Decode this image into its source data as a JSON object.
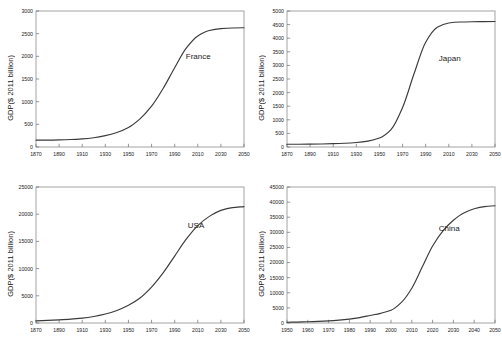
{
  "figure": {
    "panel_count": 4,
    "shared_ylabel": "GDP($ 2011 billion)",
    "background_color": "#ffffff",
    "curve_color": "#3a3a3a",
    "axis_color": "#9a9a9a"
  },
  "chart_data": [
    {
      "type": "line",
      "title": "",
      "annotation": "France",
      "xlabel": "",
      "ylabel": "GDP($ 2011 billion)",
      "xlim": [
        1870,
        2050
      ],
      "ylim": [
        0,
        3000
      ],
      "xticks": [
        1870,
        1890,
        1910,
        1930,
        1950,
        1970,
        1990,
        2010,
        2030,
        2050
      ],
      "yticks": [
        0,
        500,
        1000,
        1500,
        2000,
        2500,
        3000
      ],
      "grid": false,
      "legend": "none",
      "x": [
        1870,
        1880,
        1890,
        1900,
        1910,
        1920,
        1930,
        1940,
        1950,
        1960,
        1970,
        1980,
        1990,
        2000,
        2010,
        2020,
        2030,
        2040,
        2050
      ],
      "values": [
        150,
        152,
        157,
        165,
        180,
        205,
        250,
        320,
        430,
        620,
        900,
        1290,
        1750,
        2180,
        2450,
        2570,
        2610,
        2625,
        2630
      ]
    },
    {
      "type": "line",
      "title": "",
      "annotation": "Japan",
      "xlabel": "",
      "ylabel": "GDP($ 2011 billion)",
      "xlim": [
        1870,
        2050
      ],
      "ylim": [
        0,
        5000
      ],
      "xticks": [
        1870,
        1890,
        1910,
        1930,
        1950,
        1970,
        1990,
        2010,
        2030,
        2050
      ],
      "yticks": [
        0,
        500,
        1000,
        1500,
        2000,
        2500,
        3000,
        3500,
        4000,
        4500,
        5000
      ],
      "grid": false,
      "legend": "none",
      "x": [
        1870,
        1880,
        1890,
        1900,
        1910,
        1920,
        1930,
        1940,
        1950,
        1960,
        1970,
        1980,
        1990,
        2000,
        2010,
        2020,
        2030,
        2040,
        2050
      ],
      "values": [
        100,
        102,
        106,
        112,
        122,
        138,
        165,
        215,
        330,
        640,
        1450,
        2700,
        3850,
        4400,
        4560,
        4595,
        4605,
        4610,
        4615
      ]
    },
    {
      "type": "line",
      "title": "",
      "annotation": "USA",
      "xlabel": "",
      "ylabel": "GDP($ 2011 billion)",
      "xlim": [
        1870,
        2050
      ],
      "ylim": [
        0,
        25000
      ],
      "xticks": [
        1870,
        1890,
        1910,
        1930,
        1950,
        1970,
        1990,
        2010,
        2030,
        2050
      ],
      "yticks": [
        0,
        5000,
        10000,
        15000,
        20000,
        25000
      ],
      "grid": false,
      "legend": "none",
      "x": [
        1870,
        1880,
        1890,
        1900,
        1910,
        1920,
        1930,
        1940,
        1950,
        1960,
        1970,
        1980,
        1990,
        2000,
        2010,
        2020,
        2030,
        2040,
        2050
      ],
      "values": [
        400,
        470,
        570,
        700,
        900,
        1200,
        1650,
        2300,
        3250,
        4600,
        6600,
        9200,
        12300,
        15400,
        17900,
        19600,
        20700,
        21200,
        21400
      ]
    },
    {
      "type": "line",
      "title": "",
      "annotation": "China",
      "xlabel": "",
      "ylabel": "GDP($ 2011 billion)",
      "xlim": [
        1950,
        2050
      ],
      "ylim": [
        0,
        45000
      ],
      "xticks": [
        1950,
        1960,
        1970,
        1980,
        1990,
        2000,
        2010,
        2020,
        2030,
        2040,
        2050
      ],
      "yticks": [
        0,
        5000,
        10000,
        15000,
        20000,
        25000,
        30000,
        35000,
        40000,
        45000
      ],
      "grid": false,
      "legend": "none",
      "x": [
        1950,
        1955,
        1960,
        1965,
        1970,
        1975,
        1980,
        1985,
        1990,
        1995,
        2000,
        2005,
        2010,
        2015,
        2020,
        2025,
        2030,
        2035,
        2040,
        2045,
        2050
      ],
      "values": [
        250,
        310,
        400,
        530,
        700,
        950,
        1300,
        1800,
        2500,
        3200,
        4200,
        6800,
        11500,
        18500,
        25500,
        30500,
        34000,
        36400,
        37800,
        38500,
        38800
      ]
    }
  ]
}
